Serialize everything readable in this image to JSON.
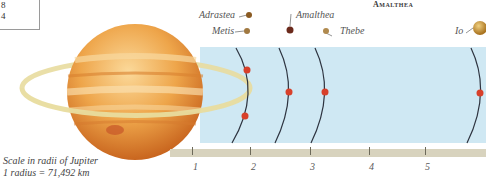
{
  "table_fragment": {
    "rows": [
      "8",
      "4"
    ]
  },
  "title": "Amalthea",
  "moons": [
    {
      "name": "Adrastea",
      "color": "#8a5a22"
    },
    {
      "name": "Metis",
      "color": "#a07840"
    },
    {
      "name": "Amalthea",
      "color": "#6b2a1c"
    },
    {
      "name": "Thebe",
      "color": "#b08a4e"
    },
    {
      "name": "Io",
      "color": "#c99a3a"
    }
  ],
  "scale": {
    "ticks": [
      "1",
      "2",
      "3",
      "4",
      "5"
    ],
    "note_line1": "Scale in radii of Jupiter",
    "note_line2": "1 radius = 71,492 km"
  },
  "colors": {
    "orbit_marker": "#d8402a",
    "orbit_line": "#2e3440",
    "sky": "#cfe8f3",
    "scale_bar": "#d8d3be",
    "ring": "#e8dc9e",
    "jupiter": "#e59a3a"
  }
}
